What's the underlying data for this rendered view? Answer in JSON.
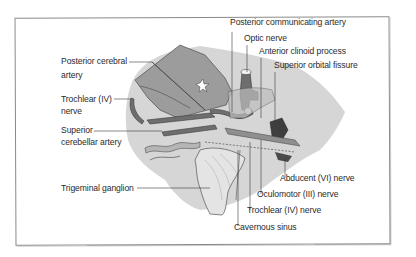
{
  "diagram": {
    "colors": {
      "background_region": "#d6d6d6",
      "brain_mass": "#9c9c9c",
      "artery": "#6e6e6e",
      "ganglion": "#e4e4e4",
      "leader_line": "#3a3a3a",
      "frame": "#8a8a8a",
      "text": "#2b2b2b"
    },
    "labels_left": [
      {
        "id": "posterior-cerebral-artery",
        "line1": "Posterior cerebral",
        "line2": "artery"
      },
      {
        "id": "trochlear-nerve-left",
        "line1": "Trochlear (IV)",
        "line2": "nerve"
      },
      {
        "id": "superior-cerebellar-artery",
        "line1": "Superior",
        "line2": "cerebellar artery"
      },
      {
        "id": "trigeminal-ganglion",
        "line1": "Trigeminal ganglion"
      }
    ],
    "labels_top": [
      {
        "id": "posterior-communicating-artery",
        "text": "Posterior communicating artery"
      },
      {
        "id": "optic-nerve",
        "text": "Optic nerve"
      },
      {
        "id": "anterior-clinoid-process",
        "text": "Anterior clinoid process"
      },
      {
        "id": "superior-orbital-fissure",
        "text": "Superior orbital fissure"
      }
    ],
    "labels_bottom": [
      {
        "id": "abducent-nerve",
        "text": "Abducent (VI) nerve"
      },
      {
        "id": "oculomotor-nerve",
        "text": "Oculomotor (III) nerve"
      },
      {
        "id": "trochlear-nerve-bottom",
        "text": "Trochlear (IV) nerve"
      },
      {
        "id": "cavernous-sinus",
        "text": "Cavernous sinus"
      }
    ]
  }
}
